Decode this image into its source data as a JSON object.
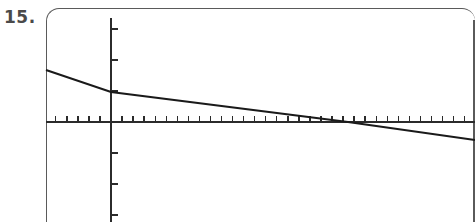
{
  "problem": {
    "number_label": "15."
  },
  "screen": {
    "frame_color": "#5a5a5a",
    "background_color": "#ffffff",
    "corner_radius_px": 13,
    "bounds": {
      "left": 46,
      "top": 8,
      "right": 475,
      "bottom": 222
    }
  },
  "chart_data": {
    "type": "line",
    "title": "",
    "subtitle": "",
    "xlabel": "",
    "ylabel": "",
    "grid": false,
    "legend_position": "none",
    "axis_style": "graphing-calculator",
    "axes": {
      "origin_px": {
        "x": 111,
        "y": 122
      },
      "x_axis": {
        "visible": true,
        "pixel_start": 46,
        "pixel_end": 475,
        "tick_spacing_px": 11.05,
        "tick_length_px": 6,
        "tick_direction": "up",
        "tick_labels_visible": false,
        "ticks_left_of_origin": 6,
        "ticks_right_of_origin": 32,
        "range": [
          -6,
          32
        ]
      },
      "y_axis": {
        "visible": true,
        "pixel_top": 18,
        "pixel_bottom": 222,
        "tick_spacing_px": 31,
        "tick_length_px": 7,
        "tick_direction": "right",
        "tick_labels_visible": false,
        "ticks_above_origin": 3,
        "ticks_below_origin": 3,
        "range": [
          -3,
          3
        ]
      }
    },
    "series": [
      {
        "name": "line",
        "color": "#1a1a1a",
        "stroke_width": 2.1,
        "slope_px_per_px": -0.1223,
        "y_intercept_px": 92,
        "x_intercept_px": 348,
        "points_px": [
          {
            "x": 46,
            "y": 70
          },
          {
            "x": 111,
            "y": 92
          },
          {
            "x": 348,
            "y": 122
          },
          {
            "x": 475,
            "y": 140
          }
        ],
        "trend": "decreasing"
      }
    ]
  }
}
